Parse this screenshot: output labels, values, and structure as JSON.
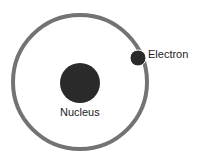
{
  "diagram": {
    "nucleus": {
      "label": "Nucleus",
      "color": "#2a2a2a"
    },
    "electron": {
      "label": "Electron",
      "color": "#2a2a2a"
    },
    "orbit": {
      "color": "#555555"
    }
  }
}
